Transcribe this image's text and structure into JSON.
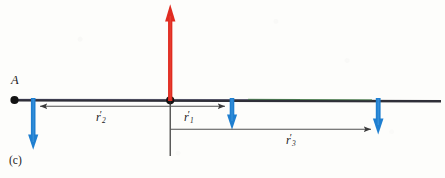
{
  "figure": {
    "part_label": "(c)",
    "point_label": "A",
    "dimensions": {
      "width": 445,
      "height": 178
    },
    "background_color": "#fdfdfb"
  },
  "labels": {
    "r1": {
      "var": "r",
      "sub": "1",
      "prime": "′"
    },
    "r2": {
      "var": "r",
      "sub": "2",
      "prime": "′"
    },
    "r3": {
      "var": "r",
      "sub": "3",
      "prime": "′"
    }
  },
  "colors": {
    "load_arrow": "#1f7fd0",
    "resultant_arrow": "#e02b20",
    "axis_line": "#2b2b33",
    "dimension_line": "#5a5a5a",
    "green_tint": "#3a7a3a",
    "node": "#111111"
  },
  "geometry": {
    "beam": {
      "x1": 14,
      "x2": 441,
      "y": 100
    },
    "node_A": {
      "x": 14,
      "y": 100
    },
    "node_center": {
      "x": 170,
      "y": 100
    },
    "resultant_up": {
      "x": 170,
      "y_tail": 100,
      "y_tip": 5
    },
    "down_arrows": [
      {
        "x": 33,
        "y_tail": 100,
        "y_tip": 149
      },
      {
        "x": 232,
        "y_tail": 100,
        "y_tip": 129
      },
      {
        "x": 378,
        "y_tail": 100,
        "y_tip": 134
      }
    ],
    "drop_line": {
      "x": 170,
      "y1": 100,
      "y2": 156
    },
    "dimensions": [
      {
        "name": "r2",
        "x_from": 170,
        "x_to": 34,
        "y": 106,
        "arrow_end": "left"
      },
      {
        "name": "r1",
        "x_from": 170,
        "x_to": 231,
        "y": 106,
        "arrow_end": "right"
      },
      {
        "name": "r3",
        "x_from": 170,
        "x_to": 377,
        "y": 129,
        "arrow_end": "right"
      }
    ]
  }
}
